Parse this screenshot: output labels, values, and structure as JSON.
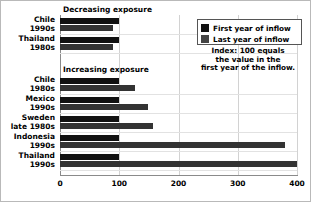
{
  "chart_data": {
    "type": "bar",
    "orientation": "horizontal",
    "title": "",
    "xlabel": "",
    "ylabel": "",
    "xlim": [
      0,
      400
    ],
    "xticks": [
      "0",
      "100",
      "200",
      "300",
      "400"
    ],
    "grid": true,
    "legend_position": "top-right",
    "note": [
      "Index: 100 equals",
      "the value in the",
      "first year of the inflow."
    ],
    "series": [
      {
        "name": "First year of inflow",
        "color": "#111111",
        "values": [
          100,
          100,
          100,
          100,
          100,
          100,
          100
        ]
      },
      {
        "name": "Last year of inflow",
        "color": "#333333",
        "values": [
          90,
          90,
          127,
          149,
          157,
          379,
          400
        ]
      }
    ],
    "categories": [
      "Chile 1990s",
      "Thailand 1980s",
      "Chile 1980s",
      "Mexico 1990s",
      "Sweden late 1980s",
      "Indonesia 1990s",
      "Thailand 1990s"
    ],
    "groups": [
      {
        "label": "Decreasing exposure",
        "rows": [
          {
            "line1": "Chile",
            "line2": "1990s",
            "first": 100,
            "last": 90
          },
          {
            "line1": "Thailand",
            "line2": "1980s",
            "first": 100,
            "last": 90
          }
        ]
      },
      {
        "label": "Increasing exposure",
        "rows": [
          {
            "line1": "Chile",
            "line2": "1980s",
            "first": 100,
            "last": 127
          },
          {
            "line1": "Mexico",
            "line2": "1990s",
            "first": 100,
            "last": 149
          },
          {
            "line1": "Sweden",
            "line2": "late 1980s",
            "first": 100,
            "last": 157
          },
          {
            "line1": "Indonesia",
            "line2": "1990s",
            "first": 100,
            "last": 379
          },
          {
            "line1": "Thailand",
            "line2": "1990s",
            "first": 100,
            "last": 400
          }
        ]
      }
    ]
  },
  "legend": {
    "items": [
      {
        "label": "First year of inflow"
      },
      {
        "label": "Last year of inflow"
      }
    ]
  }
}
